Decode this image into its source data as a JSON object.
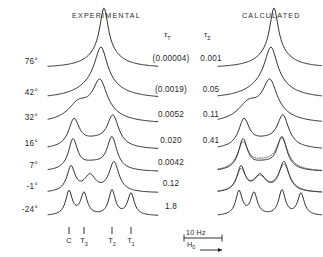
{
  "figure": {
    "columns": {
      "experimental_title": "EXPERIMENTAL",
      "calculated_title": "CALCULATED"
    },
    "tau_t_header": "τ",
    "tau_t_subscript": "T",
    "tau_sigma_header": "τ",
    "tau_sigma_subscript": "Σ",
    "scale_bar_label": "10 Hz",
    "field_axis_label": "H",
    "field_axis_subscript": "0",
    "peak_labels": [
      {
        "name": "C",
        "sub": "",
        "x": 69
      },
      {
        "name": "T",
        "sub": "3",
        "x": 84
      },
      {
        "name": "T",
        "sub": "2",
        "x": 112
      },
      {
        "name": "T",
        "sub": "1",
        "x": 131
      }
    ],
    "rows": [
      {
        "temperature": "76°",
        "tau_t": "(0.00004)",
        "tau_sigma": "0.001"
      },
      {
        "temperature": "42°",
        "tau_t": "(0.0019)",
        "tau_sigma": "0.05"
      },
      {
        "temperature": "32°",
        "tau_t": "0.0052",
        "tau_sigma": "0.11"
      },
      {
        "temperature": "16°",
        "tau_t": "0.020",
        "tau_sigma": "0.41"
      },
      {
        "temperature": "7°",
        "tau_t": "0.0042",
        "tau_sigma": ""
      },
      {
        "temperature": "-1°",
        "tau_t": "0.12",
        "tau_sigma": ""
      },
      {
        "temperature": "-24°",
        "tau_t": "1.8",
        "tau_sigma": ""
      }
    ]
  },
  "chart_data": {
    "type": "line",
    "xlabel": "H0",
    "ylabel": "",
    "grid": false,
    "legend": null,
    "scale_bar_hz": 10,
    "peak_positions": {
      "C": 69,
      "T3": 84,
      "T2": 112,
      "T1": 131
    },
    "series": [
      {
        "name": "76° experimental",
        "panel": "experimental",
        "row": 0,
        "temperature": "76°",
        "tau_t": "(0.00004)",
        "style": "solid",
        "peaks": [
          {
            "center": 104,
            "height": 44,
            "width": 5.0
          },
          {
            "center": 104,
            "height": 16,
            "width": 17.0
          }
        ]
      },
      {
        "name": "76° calculated",
        "panel": "calculated",
        "row": 0,
        "tau_sigma": "0.001",
        "style": "solid",
        "peaks": [
          {
            "center": 274,
            "height": 44,
            "width": 5.0
          },
          {
            "center": 274,
            "height": 16,
            "width": 17.0
          }
        ]
      },
      {
        "name": "42° experimental",
        "panel": "experimental",
        "row": 1,
        "temperature": "42°",
        "tau_t": "(0.0019)",
        "style": "solid",
        "peaks": [
          {
            "center": 101,
            "height": 36,
            "width": 7.5
          },
          {
            "center": 99,
            "height": 16,
            "width": 22.0
          }
        ]
      },
      {
        "name": "42° calculated",
        "panel": "calculated",
        "row": 1,
        "tau_sigma": "0.05",
        "style": "solid",
        "peaks": [
          {
            "center": 271,
            "height": 36,
            "width": 7.5
          },
          {
            "center": 269,
            "height": 16,
            "width": 22.0
          }
        ]
      },
      {
        "name": "32° experimental",
        "panel": "experimental",
        "row": 2,
        "temperature": "32°",
        "tau_t": "0.0052",
        "style": "solid",
        "peaks": [
          {
            "center": 100,
            "height": 32,
            "width": 8.5
          },
          {
            "center": 78,
            "height": 14,
            "width": 12.0
          },
          {
            "center": 96,
            "height": 10,
            "width": 24.0
          }
        ]
      },
      {
        "name": "32° calculated",
        "panel": "calculated",
        "row": 2,
        "tau_sigma": "0.11",
        "style": "solid",
        "peaks": [
          {
            "center": 270,
            "height": 32,
            "width": 8.5
          },
          {
            "center": 248,
            "height": 14,
            "width": 12.0
          },
          {
            "center": 266,
            "height": 10,
            "width": 24.0
          }
        ]
      },
      {
        "name": "16° experimental",
        "panel": "experimental",
        "row": 3,
        "temperature": "16°",
        "tau_t": "0.020",
        "style": "solid",
        "peaks": [
          {
            "center": 74,
            "height": 27,
            "width": 6.5
          },
          {
            "center": 113,
            "height": 30,
            "width": 7.0
          },
          {
            "center": 95,
            "height": 8,
            "width": 20.0
          }
        ]
      },
      {
        "name": "16° calculated",
        "panel": "calculated",
        "row": 3,
        "tau_sigma": "0.41",
        "style": "solid",
        "peaks": [
          {
            "center": 244,
            "height": 27,
            "width": 6.5
          },
          {
            "center": 283,
            "height": 30,
            "width": 7.0
          },
          {
            "center": 265,
            "height": 8,
            "width": 20.0
          }
        ]
      },
      {
        "name": "7° experimental",
        "panel": "experimental",
        "row": 4,
        "temperature": "7°",
        "tau_t": "0.0042",
        "style": "solid",
        "peaks": [
          {
            "center": 73,
            "height": 30,
            "width": 5.5
          },
          {
            "center": 112,
            "height": 32,
            "width": 6.0
          },
          {
            "center": 93,
            "height": 7,
            "width": 16.0
          }
        ]
      },
      {
        "name": "7° calculated solid",
        "panel": "calculated",
        "row": 4,
        "style": "solid",
        "peaks": [
          {
            "center": 243,
            "height": 30,
            "width": 5.5
          },
          {
            "center": 282,
            "height": 32,
            "width": 6.0
          },
          {
            "center": 263,
            "height": 7,
            "width": 16.0
          }
        ]
      },
      {
        "name": "7° calculated dotted",
        "panel": "calculated",
        "row": 4,
        "style": "dotted",
        "peaks": [
          {
            "center": 243,
            "height": 26,
            "width": 6.5
          },
          {
            "center": 282,
            "height": 30,
            "width": 7.0
          },
          {
            "center": 263,
            "height": 8,
            "width": 17.0
          }
        ]
      },
      {
        "name": "-1° experimental",
        "panel": "experimental",
        "row": 5,
        "temperature": "-1°",
        "tau_t": "0.12",
        "style": "solid",
        "peaks": [
          {
            "center": 71,
            "height": 25,
            "width": 5.0
          },
          {
            "center": 90,
            "height": 16,
            "width": 7.0
          },
          {
            "center": 114,
            "height": 30,
            "width": 6.0
          }
        ]
      },
      {
        "name": "-1° calculated solid",
        "panel": "calculated",
        "row": 5,
        "style": "solid",
        "peaks": [
          {
            "center": 241,
            "height": 25,
            "width": 5.0
          },
          {
            "center": 260,
            "height": 16,
            "width": 7.0
          },
          {
            "center": 284,
            "height": 30,
            "width": 6.0
          }
        ]
      },
      {
        "name": "-1° calculated dotted",
        "panel": "calculated",
        "row": 5,
        "style": "dotted",
        "peaks": [
          {
            "center": 241,
            "height": 22,
            "width": 5.5
          },
          {
            "center": 260,
            "height": 14,
            "width": 8.0
          },
          {
            "center": 284,
            "height": 27,
            "width": 7.0
          }
        ]
      },
      {
        "name": "-24° experimental",
        "panel": "experimental",
        "row": 6,
        "temperature": "-24°",
        "tau_t": "1.8",
        "style": "solid",
        "peaks": [
          {
            "center": 69,
            "height": 24,
            "width": 4.0
          },
          {
            "center": 84,
            "height": 22,
            "width": 4.0
          },
          {
            "center": 112,
            "height": 25,
            "width": 4.0
          },
          {
            "center": 131,
            "height": 22,
            "width": 4.0
          }
        ]
      },
      {
        "name": "-24° calculated",
        "panel": "calculated",
        "row": 6,
        "style": "solid",
        "peaks": [
          {
            "center": 239,
            "height": 24,
            "width": 4.0
          },
          {
            "center": 254,
            "height": 22,
            "width": 4.0
          },
          {
            "center": 282,
            "height": 25,
            "width": 4.0
          },
          {
            "center": 301,
            "height": 22,
            "width": 4.0
          }
        ]
      }
    ]
  }
}
